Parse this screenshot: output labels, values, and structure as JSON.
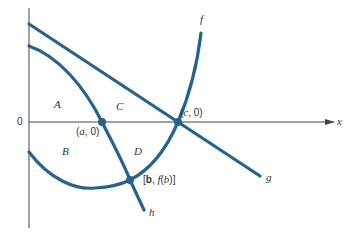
{
  "diagram": {
    "colors": {
      "curve": "#26628c",
      "axis": "#444444",
      "text": "#333333"
    },
    "axes": {
      "x_label": "x",
      "origin_label": "0"
    },
    "curves": [
      {
        "id": "f",
        "label": "f"
      },
      {
        "id": "g",
        "label": "g"
      },
      {
        "id": "h",
        "label": "h"
      }
    ],
    "points": [
      {
        "id": "a",
        "label": "(a, 0)"
      },
      {
        "id": "c",
        "label": "(c, 0)"
      },
      {
        "id": "b",
        "label": "[b, f(b)]",
        "label_parts": [
          "[",
          "b",
          ", ",
          "f",
          "(",
          "b",
          ")]"
        ]
      }
    ],
    "regions": [
      {
        "id": "A",
        "label": "A"
      },
      {
        "id": "B",
        "label": "B"
      },
      {
        "id": "C",
        "label": "C"
      },
      {
        "id": "D",
        "label": "D"
      }
    ]
  }
}
